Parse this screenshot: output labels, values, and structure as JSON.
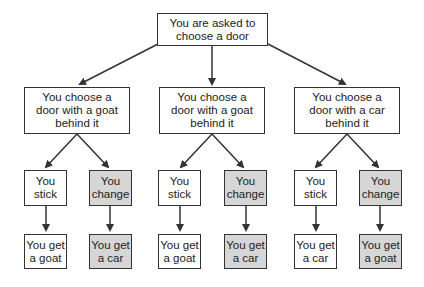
{
  "diagram": {
    "root": {
      "label": "You are asked to\nchoose a door"
    },
    "branches": [
      {
        "label": "You choose a\ndoor with a goat\nbehind it",
        "stick": {
          "label": "You\nstick",
          "outcome": "You get\na goat"
        },
        "change": {
          "label": "You\nchange",
          "outcome": "You get\na car"
        }
      },
      {
        "label": "You choose a\ndoor with a goat\nbehind it",
        "stick": {
          "label": "You\nstick",
          "outcome": "You get\na goat"
        },
        "change": {
          "label": "You\nchange",
          "outcome": "You get\na car"
        }
      },
      {
        "label": "You choose a\ndoor with a car\nbehind it",
        "stick": {
          "label": "You\nstick",
          "outcome": "You get\na car"
        },
        "change": {
          "label": "You\nchange",
          "outcome": "You get\na goat"
        }
      }
    ],
    "colors": {
      "shaded": "#d6d6d6",
      "line": "#333333"
    }
  }
}
